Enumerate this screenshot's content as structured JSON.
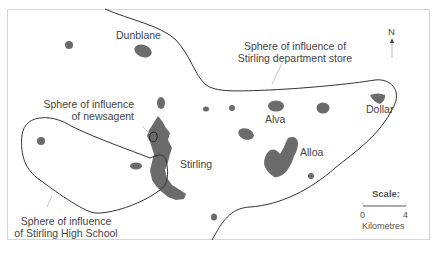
{
  "map": {
    "towns": [
      {
        "name": "Dunblane"
      },
      {
        "name": "Stirling"
      },
      {
        "name": "Alva"
      },
      {
        "name": "Alloa"
      },
      {
        "name": "Dollar"
      }
    ],
    "spheres": [
      {
        "label_line1": "Sphere of influence of",
        "label_line2": "Stirling department store"
      },
      {
        "label_line1": "Sphere of influence",
        "label_line2": "of newsagent"
      },
      {
        "label_line1": "Sphere of influence",
        "label_line2": "of Stirling High School"
      }
    ],
    "north_arrow": {
      "label": "N"
    },
    "scale": {
      "title": "Scale:",
      "min": "0",
      "max": "4",
      "unit": "Kilometres"
    },
    "colors": {
      "settlement": "#6b6b6b",
      "boundary": "#333333",
      "frame": "#d4d4d4",
      "text": "#444444"
    }
  }
}
